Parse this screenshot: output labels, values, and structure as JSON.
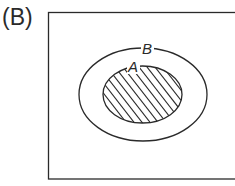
{
  "panel": {
    "label": "(B)"
  },
  "diagram": {
    "type": "venn-subset",
    "universe": {
      "shape": "rectangle"
    },
    "sets": [
      {
        "name": "B",
        "label": "B",
        "role": "outer set",
        "shaded": false
      },
      {
        "name": "A",
        "label": "A",
        "role": "subset of B",
        "shaded": true,
        "pattern": "diagonal-hatch"
      }
    ],
    "relation": "A ⊂ B",
    "colors": {
      "stroke": "#2a2a2a",
      "background": "#ffffff"
    }
  }
}
